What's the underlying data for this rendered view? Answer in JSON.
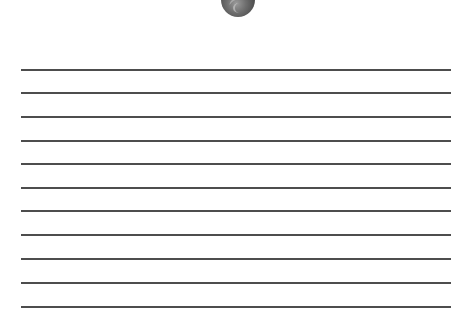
{
  "page": {
    "background": "#ffffff",
    "coin": {
      "icon": "coin-icon",
      "color": "#5a5a5a"
    },
    "lines": {
      "color": "#4d4d4d",
      "count": 11,
      "positions_y": [
        70,
        93,
        117,
        141,
        164,
        188,
        211,
        235,
        259,
        283,
        307
      ]
    }
  }
}
